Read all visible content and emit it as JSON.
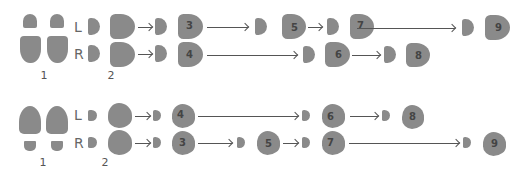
{
  "colors": {
    "footprint": "#8a8a8a",
    "arrow": "#555555",
    "text": "#555555"
  },
  "diagrams": [
    {
      "id": "top",
      "step1_label": "1",
      "step2_label": "2",
      "rows": [
        {
          "side": "L",
          "steps": [
            "3",
            "5",
            "7",
            "9"
          ]
        },
        {
          "side": "R",
          "steps": [
            "4",
            "6",
            "8"
          ]
        }
      ]
    },
    {
      "id": "bottom",
      "step1_label": "1",
      "step2_label": "2",
      "rows": [
        {
          "side": "L",
          "steps": [
            "4",
            "6",
            "8"
          ]
        },
        {
          "side": "R",
          "steps": [
            "3",
            "5",
            "7",
            "9"
          ]
        }
      ]
    }
  ]
}
